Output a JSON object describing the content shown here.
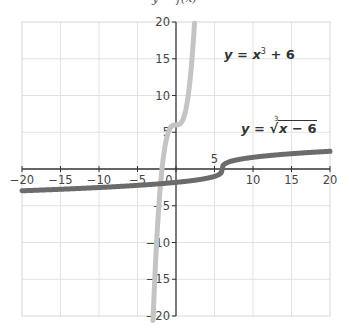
{
  "chart_data": {
    "type": "line",
    "title": "y = f(x)",
    "xlabel": "",
    "ylabel": "",
    "xlim": [
      -20,
      20
    ],
    "ylim": [
      -20,
      20
    ],
    "grid": true,
    "legend": "none (inline equation labels)",
    "x_ticks": [
      -20,
      -15,
      -10,
      -5,
      0,
      5,
      10,
      15,
      20
    ],
    "x_tick_labels": [
      "−20",
      "−15",
      "−10",
      "−5",
      "0",
      "5",
      "10",
      "15",
      "20"
    ],
    "y_ticks": [
      -20,
      -15,
      -10,
      -5,
      5,
      10,
      15,
      20
    ],
    "y_tick_labels": [
      "−20",
      "−15",
      "−10",
      "−5",
      "5",
      "10",
      "15",
      "20"
    ],
    "series": [
      {
        "name": "y = x³ + 6",
        "formula": "x^3 + 6",
        "color": "#c4c4c4",
        "domain": [
          -3.0,
          2.4
        ],
        "x": [
          -3.0,
          -2.5,
          -2.0,
          -1.5,
          -1.0,
          -0.5,
          0,
          0.5,
          1.0,
          1.5,
          2.0,
          2.4
        ],
        "values": [
          -21,
          -9.63,
          -2,
          2.63,
          5,
          5.88,
          6,
          6.13,
          7,
          9.38,
          14,
          19.82
        ]
      },
      {
        "name": "y = ∛(x − 6)",
        "formula": "cbrt(x - 6)",
        "color": "#6b6b6b",
        "domain": [
          -20,
          20
        ],
        "x": [
          -20,
          -15,
          -10,
          -5,
          0,
          5,
          6,
          7,
          10,
          15,
          20
        ],
        "values": [
          -2.96,
          -2.76,
          -2.52,
          -2.22,
          -1.82,
          -1.0,
          0,
          1.0,
          1.59,
          2.08,
          2.41
        ]
      }
    ],
    "annotations": [
      {
        "text": "y = x³ + 6",
        "position": [
          10.5,
          16
        ]
      },
      {
        "text": "y = ∛(x − 6)",
        "position": [
          12,
          6
        ]
      }
    ]
  },
  "labels": {
    "title": "y = f(x)",
    "eq1_y": "y",
    "eq1_mid": " = ",
    "eq1_x": "x",
    "eq1_exp": "3",
    "eq1_tail": " + 6",
    "eq2_y": "y",
    "eq2_mid": " = ",
    "eq2_idx": "3",
    "eq2_rad": "√",
    "eq2_radicand_x": "x",
    "eq2_radicand_tail": " − 6"
  }
}
